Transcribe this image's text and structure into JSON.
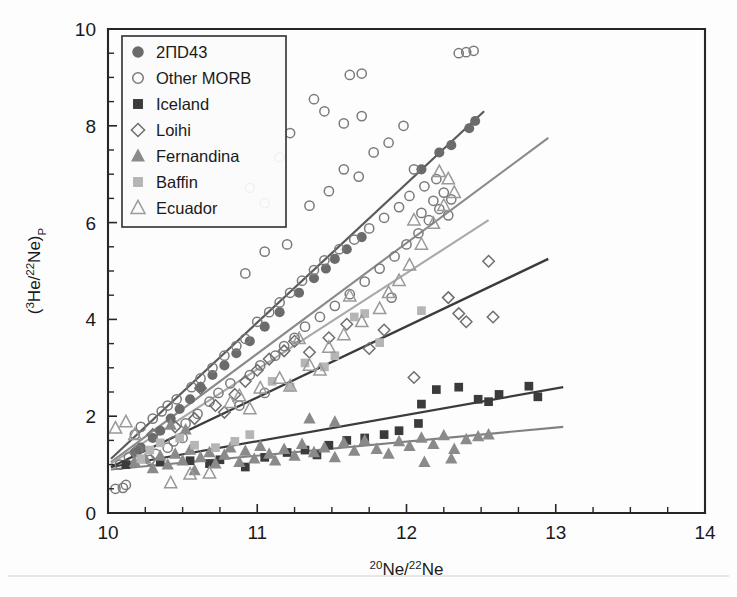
{
  "figure": {
    "background": "#fdfdfd",
    "width": 737,
    "height": 597
  },
  "axes": {
    "x_title_main": "Ne/",
    "x_title_sup1": "20",
    "x_title_sup2": "22",
    "x_title_tail": "Ne",
    "y_title_open": "(",
    "y_title_sup1": "3",
    "y_title_mid": "He/",
    "y_title_sup2": "22",
    "y_title_close": "Ne)",
    "y_title_sub": "P",
    "x_ticklabels": [
      "10",
      "11",
      "12",
      "13",
      "14"
    ],
    "y_ticklabels": [
      "0",
      "2",
      "4",
      "6",
      "8",
      "10"
    ]
  },
  "legend": {
    "items": [
      {
        "label": "2ΠD43",
        "marker": "filled-circle",
        "color": "#6b6b6b"
      },
      {
        "label": "Other MORB",
        "marker": "open-circle",
        "color": "#7a7a7a"
      },
      {
        "label": "Iceland",
        "marker": "filled-square",
        "color": "#3b3b3b"
      },
      {
        "label": "Loihi",
        "marker": "open-diamond",
        "color": "#6e6e6e"
      },
      {
        "label": "Fernandina",
        "marker": "filled-triangle",
        "color": "#8a8a8a"
      },
      {
        "label": "Baffin",
        "marker": "filled-square",
        "color": "#b5b5b5"
      },
      {
        "label": "Ecuador",
        "marker": "open-triangle",
        "color": "#9a9a9a"
      }
    ]
  },
  "chart_data": {
    "type": "scatter",
    "title": "",
    "xlabel": "20Ne/22Ne",
    "ylabel": "(3He/22Ne)_P",
    "xlim": [
      10,
      14
    ],
    "ylim": [
      0,
      10
    ],
    "xticks": [
      10,
      11,
      12,
      13,
      14
    ],
    "yticks": [
      0,
      2,
      4,
      6,
      8,
      10
    ],
    "x_minor_step": 0.25,
    "y_minor_step": 0.5,
    "grid": false,
    "legend_position": "top-left",
    "series": [
      {
        "name": "2ΠD43",
        "marker": "filled-circle",
        "color": "#6b6b6b",
        "points": [
          [
            10.18,
            1.25
          ],
          [
            10.22,
            1.35
          ],
          [
            10.3,
            1.55
          ],
          [
            10.35,
            1.7
          ],
          [
            10.42,
            1.95
          ],
          [
            10.48,
            2.15
          ],
          [
            10.55,
            2.35
          ],
          [
            10.62,
            2.6
          ],
          [
            10.7,
            2.85
          ],
          [
            10.78,
            3.05
          ],
          [
            10.86,
            3.3
          ],
          [
            10.95,
            3.55
          ],
          [
            11.05,
            3.85
          ],
          [
            11.15,
            4.15
          ],
          [
            11.28,
            4.55
          ],
          [
            11.38,
            4.85
          ],
          [
            11.46,
            5.05
          ],
          [
            11.52,
            5.25
          ],
          [
            11.6,
            5.45
          ],
          [
            11.7,
            5.7
          ],
          [
            12.1,
            7.1
          ],
          [
            12.22,
            7.45
          ],
          [
            12.3,
            7.6
          ],
          [
            12.42,
            7.95
          ],
          [
            12.46,
            8.1
          ]
        ]
      },
      {
        "name": "Other MORB",
        "marker": "open-circle",
        "color": "#7a7a7a",
        "points": [
          [
            10.05,
            0.5
          ],
          [
            10.1,
            0.52
          ],
          [
            10.12,
            0.58
          ],
          [
            10.08,
            1.0
          ],
          [
            10.14,
            1.15
          ],
          [
            10.2,
            1.3
          ],
          [
            10.18,
            1.62
          ],
          [
            10.22,
            1.78
          ],
          [
            10.28,
            1.1
          ],
          [
            10.32,
            1.22
          ],
          [
            10.3,
            1.95
          ],
          [
            10.36,
            2.1
          ],
          [
            10.4,
            1.35
          ],
          [
            10.44,
            1.48
          ],
          [
            10.4,
            2.22
          ],
          [
            10.46,
            2.35
          ],
          [
            10.5,
            1.55
          ],
          [
            10.52,
            1.85
          ],
          [
            10.56,
            2.6
          ],
          [
            10.6,
            2.05
          ],
          [
            10.62,
            2.78
          ],
          [
            10.68,
            2.3
          ],
          [
            10.7,
            3.0
          ],
          [
            10.74,
            2.48
          ],
          [
            10.78,
            3.25
          ],
          [
            10.82,
            2.68
          ],
          [
            10.86,
            3.45
          ],
          [
            10.88,
            2.22
          ],
          [
            10.92,
            3.6
          ],
          [
            10.95,
            2.85
          ],
          [
            11.0,
            3.95
          ],
          [
            11.02,
            3.05
          ],
          [
            11.05,
            2.48
          ],
          [
            11.08,
            4.15
          ],
          [
            11.12,
            3.25
          ],
          [
            11.15,
            4.35
          ],
          [
            11.18,
            3.45
          ],
          [
            11.2,
            5.55
          ],
          [
            11.22,
            4.55
          ],
          [
            11.25,
            3.62
          ],
          [
            11.3,
            4.8
          ],
          [
            11.32,
            3.85
          ],
          [
            11.35,
            6.35
          ],
          [
            11.38,
            5.02
          ],
          [
            11.42,
            4.05
          ],
          [
            11.45,
            5.22
          ],
          [
            11.48,
            6.65
          ],
          [
            11.52,
            4.28
          ],
          [
            11.55,
            5.45
          ],
          [
            11.58,
            7.1
          ],
          [
            11.62,
            4.52
          ],
          [
            11.65,
            5.65
          ],
          [
            11.68,
            6.95
          ],
          [
            11.7,
            8.2
          ],
          [
            11.72,
            4.78
          ],
          [
            11.75,
            5.88
          ],
          [
            11.78,
            7.45
          ],
          [
            11.82,
            5.05
          ],
          [
            11.85,
            6.1
          ],
          [
            11.88,
            7.65
          ],
          [
            11.9,
            4.45
          ],
          [
            11.92,
            5.3
          ],
          [
            11.95,
            6.32
          ],
          [
            11.98,
            8.0
          ],
          [
            12.0,
            5.55
          ],
          [
            12.02,
            6.55
          ],
          [
            12.05,
            7.1
          ],
          [
            12.08,
            5.78
          ],
          [
            12.1,
            6.2
          ],
          [
            12.12,
            6.75
          ],
          [
            12.15,
            6.05
          ],
          [
            12.18,
            6.45
          ],
          [
            12.2,
            6.9
          ],
          [
            12.22,
            6.28
          ],
          [
            12.25,
            6.62
          ],
          [
            12.28,
            6.15
          ],
          [
            12.3,
            6.48
          ],
          [
            12.35,
            9.5
          ],
          [
            12.4,
            9.52
          ],
          [
            12.45,
            9.55
          ],
          [
            11.62,
            9.05
          ],
          [
            11.7,
            9.08
          ],
          [
            10.95,
            6.72
          ],
          [
            11.05,
            6.4
          ],
          [
            11.15,
            7.35
          ],
          [
            11.22,
            7.85
          ],
          [
            11.38,
            8.55
          ],
          [
            11.45,
            8.3
          ],
          [
            11.05,
            5.4
          ],
          [
            10.92,
            4.95
          ],
          [
            11.58,
            8.05
          ]
        ]
      },
      {
        "name": "Iceland",
        "marker": "filled-square",
        "color": "#3b3b3b",
        "points": [
          [
            10.12,
            1.0
          ],
          [
            10.35,
            1.05
          ],
          [
            10.55,
            1.08
          ],
          [
            10.75,
            1.1
          ],
          [
            10.92,
            0.95
          ],
          [
            11.05,
            1.15
          ],
          [
            11.2,
            1.25
          ],
          [
            11.32,
            1.3
          ],
          [
            11.48,
            1.4
          ],
          [
            11.6,
            1.5
          ],
          [
            11.72,
            1.55
          ],
          [
            11.85,
            1.62
          ],
          [
            11.95,
            1.7
          ],
          [
            12.08,
            1.85
          ],
          [
            12.2,
            2.55
          ],
          [
            12.35,
            2.6
          ],
          [
            12.1,
            2.25
          ],
          [
            12.48,
            2.35
          ],
          [
            12.55,
            2.3
          ],
          [
            12.82,
            2.62
          ],
          [
            12.88,
            2.4
          ],
          [
            11.4,
            1.2
          ],
          [
            10.68,
            1.02
          ],
          [
            12.62,
            2.45
          ]
        ]
      },
      {
        "name": "Loihi",
        "marker": "open-diamond",
        "color": "#6e6e6e",
        "points": [
          [
            10.3,
            1.62
          ],
          [
            10.45,
            1.78
          ],
          [
            10.58,
            1.95
          ],
          [
            10.72,
            2.22
          ],
          [
            10.85,
            2.45
          ],
          [
            10.92,
            2.72
          ],
          [
            11.0,
            2.95
          ],
          [
            11.08,
            3.18
          ],
          [
            11.18,
            3.35
          ],
          [
            11.25,
            3.55
          ],
          [
            11.35,
            3.32
          ],
          [
            11.48,
            3.62
          ],
          [
            11.6,
            3.9
          ],
          [
            11.75,
            3.4
          ],
          [
            11.85,
            3.78
          ],
          [
            12.05,
            2.8
          ],
          [
            12.28,
            4.45
          ],
          [
            12.35,
            4.12
          ],
          [
            12.4,
            3.95
          ],
          [
            12.55,
            5.2
          ],
          [
            12.58,
            4.05
          ],
          [
            10.62,
            2.58
          ],
          [
            10.78,
            2.08
          ]
        ]
      },
      {
        "name": "Fernandina",
        "marker": "filled-triangle",
        "color": "#8a8a8a",
        "points": [
          [
            10.18,
            1.05
          ],
          [
            10.25,
            1.12
          ],
          [
            10.3,
            0.92
          ],
          [
            10.35,
            1.18
          ],
          [
            10.4,
            1.0
          ],
          [
            10.45,
            1.22
          ],
          [
            10.5,
            1.08
          ],
          [
            10.55,
            1.3
          ],
          [
            10.58,
            0.88
          ],
          [
            10.62,
            1.15
          ],
          [
            10.68,
            1.25
          ],
          [
            10.72,
            1.02
          ],
          [
            10.78,
            1.2
          ],
          [
            10.82,
            1.35
          ],
          [
            10.88,
            1.05
          ],
          [
            10.92,
            1.28
          ],
          [
            10.98,
            1.12
          ],
          [
            11.02,
            1.38
          ],
          [
            11.08,
            1.22
          ],
          [
            11.12,
            1.08
          ],
          [
            11.18,
            1.32
          ],
          [
            11.25,
            1.18
          ],
          [
            11.3,
            1.42
          ],
          [
            11.38,
            1.25
          ],
          [
            11.45,
            1.35
          ],
          [
            11.52,
            1.15
          ],
          [
            11.58,
            1.45
          ],
          [
            11.65,
            1.28
          ],
          [
            11.72,
            1.5
          ],
          [
            11.8,
            1.32
          ],
          [
            11.88,
            1.22
          ],
          [
            11.95,
            1.48
          ],
          [
            12.02,
            1.38
          ],
          [
            12.1,
            1.55
          ],
          [
            12.18,
            1.42
          ],
          [
            12.25,
            1.6
          ],
          [
            12.32,
            1.32
          ],
          [
            12.4,
            1.52
          ],
          [
            12.48,
            1.58
          ],
          [
            12.55,
            1.62
          ],
          [
            12.12,
            1.05
          ],
          [
            12.3,
            1.12
          ],
          [
            10.42,
            1.82
          ],
          [
            10.52,
            1.72
          ],
          [
            11.35,
            1.95
          ],
          [
            11.52,
            1.88
          ]
        ]
      },
      {
        "name": "Baffin",
        "marker": "filled-square",
        "color": "#b5b5b5",
        "points": [
          [
            10.22,
            1.12
          ],
          [
            10.28,
            1.3
          ],
          [
            10.35,
            1.45
          ],
          [
            10.48,
            1.55
          ],
          [
            10.58,
            1.4
          ],
          [
            10.72,
            1.35
          ],
          [
            10.85,
            1.48
          ],
          [
            11.1,
            2.72
          ],
          [
            11.32,
            3.1
          ],
          [
            11.45,
            3.02
          ],
          [
            11.52,
            3.25
          ],
          [
            11.65,
            4.05
          ],
          [
            11.72,
            4.12
          ],
          [
            11.82,
            3.52
          ],
          [
            12.1,
            4.18
          ],
          [
            11.22,
            2.6
          ],
          [
            10.95,
            1.62
          ]
        ]
      },
      {
        "name": "Ecuador",
        "marker": "open-triangle",
        "color": "#9a9a9a",
        "points": [
          [
            10.05,
            1.75
          ],
          [
            10.12,
            1.88
          ],
          [
            10.18,
            1.62
          ],
          [
            10.42,
            0.62
          ],
          [
            10.55,
            0.8
          ],
          [
            10.68,
            0.82
          ],
          [
            10.82,
            2.28
          ],
          [
            10.88,
            2.42
          ],
          [
            11.02,
            2.58
          ],
          [
            11.15,
            2.78
          ],
          [
            11.22,
            2.62
          ],
          [
            11.35,
            3.05
          ],
          [
            11.48,
            3.42
          ],
          [
            11.58,
            3.68
          ],
          [
            11.7,
            3.95
          ],
          [
            11.82,
            4.22
          ],
          [
            11.88,
            4.55
          ],
          [
            11.95,
            4.8
          ],
          [
            12.02,
            5.12
          ],
          [
            12.1,
            5.55
          ],
          [
            12.18,
            5.98
          ],
          [
            12.25,
            6.35
          ],
          [
            12.32,
            6.62
          ],
          [
            12.05,
            6.05
          ],
          [
            11.62,
            4.48
          ],
          [
            11.42,
            2.95
          ],
          [
            10.95,
            2.15
          ],
          [
            11.28,
            3.6
          ],
          [
            12.22,
            7.05
          ],
          [
            12.28,
            6.9
          ]
        ]
      }
    ],
    "trendlines": [
      {
        "name": "2ΠD43-trend",
        "color": "#5a5a5a",
        "width": 2.2,
        "x0": 10.02,
        "y0": 1.12,
        "x1": 12.52,
        "y1": 8.3
      },
      {
        "name": "Ecuador-trend",
        "color": "#8a8a8a",
        "width": 2.1,
        "x0": 10.02,
        "y0": 1.05,
        "x1": 12.95,
        "y1": 7.75
      },
      {
        "name": "Baffin-trend",
        "color": "#a9a9a9",
        "width": 2.1,
        "x0": 10.02,
        "y0": 1.02,
        "x1": 12.55,
        "y1": 6.05
      },
      {
        "name": "Loihi-trend",
        "color": "#3b3b3b",
        "width": 2.4,
        "x0": 10.02,
        "y0": 0.95,
        "x1": 12.95,
        "y1": 5.25
      },
      {
        "name": "Iceland-trend",
        "color": "#3b3b3b",
        "width": 2.2,
        "x0": 10.02,
        "y0": 0.95,
        "x1": 13.05,
        "y1": 2.6
      },
      {
        "name": "Fernandina-trend",
        "color": "#808080",
        "width": 2.1,
        "x0": 10.02,
        "y0": 0.9,
        "x1": 13.05,
        "y1": 1.78
      }
    ]
  }
}
